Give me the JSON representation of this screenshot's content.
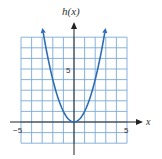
{
  "chart_data": {
    "type": "line",
    "title": "",
    "xlabel": "x",
    "ylabel": "h(x)",
    "function": "h(x) = x^2",
    "xlim": [
      -5,
      5
    ],
    "ylim": [
      -2,
      8
    ],
    "grid": true,
    "x_tick_labels": [
      "-5",
      "5"
    ],
    "y_tick_labels": [
      "5"
    ],
    "series": [
      {
        "name": "h(x)",
        "x": [
          -2.9,
          -2.5,
          -2,
          -1.5,
          -1,
          -0.5,
          0,
          0.5,
          1,
          1.5,
          2,
          2.5,
          2.9
        ],
        "y": [
          8.41,
          6.25,
          4,
          2.25,
          1,
          0.25,
          0,
          0.25,
          1,
          2.25,
          4,
          6.25,
          8.41
        ],
        "color": "#2e6db5"
      }
    ],
    "colors": {
      "grid": "#7aaad8",
      "axis": "#222222",
      "curve": "#2e6db5"
    }
  },
  "labels": {
    "y_axis": "h(x)",
    "x_axis": "x",
    "x_min": "−5",
    "x_max": "5",
    "y_tick": "5"
  }
}
